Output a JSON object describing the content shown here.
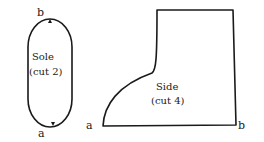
{
  "sole": {
    "title": "Sole",
    "note": "(cut 2)",
    "top_label": "b",
    "bottom_label": "a"
  },
  "side": {
    "title": "Side",
    "note": "(cut 4)",
    "left_label": "a",
    "right_label": "b"
  },
  "colors": {
    "ink": "#1a1a1a",
    "background": "#ffffff"
  }
}
